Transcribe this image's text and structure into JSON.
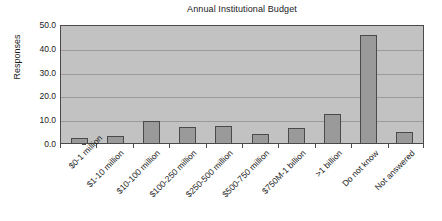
{
  "chart_data": {
    "type": "bar",
    "title": "Annual Institutional Budget",
    "xlabel": "",
    "ylabel": "Responses",
    "ylim": [
      0,
      50
    ],
    "yticks": [
      "0.0",
      "10.0",
      "20.0",
      "30.0",
      "40.0",
      "50.0"
    ],
    "ytick_values": [
      0,
      10,
      20,
      30,
      40,
      50
    ],
    "grid": true,
    "legend": "none",
    "categories": [
      "$0-1 million",
      "$1-10 million",
      "$10-100 million",
      "$100-250 million",
      "$250-500 million",
      "$500-750 million",
      "$750M-1 billion",
      ">1 billion",
      "Do not know",
      "Not answered"
    ],
    "values": [
      2.1,
      2.9,
      9.3,
      6.9,
      7.3,
      3.8,
      6.1,
      12.2,
      45.3,
      4.5
    ],
    "colors": {
      "bar_fill": "#9a9a9a",
      "bar_edge": "#4a4a4a",
      "plot_background": "#c2c2c2",
      "gridline": "#9a9a9a",
      "axis": "#4a4a4a",
      "text": "#1a1a1a",
      "figure_background": "#ffffff"
    }
  }
}
